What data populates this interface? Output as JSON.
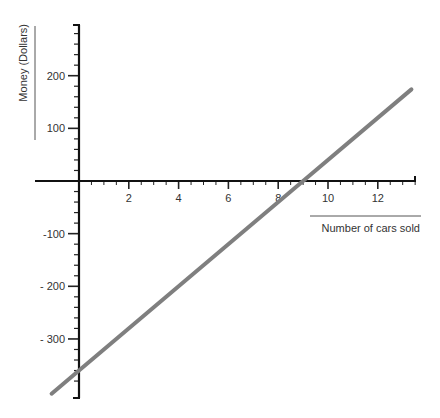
{
  "chart_data": {
    "type": "line",
    "title": "",
    "xlabel": "Number of cars sold",
    "ylabel": "Money (Dollars)",
    "xlim": [
      0,
      13.5
    ],
    "ylim": [
      -390,
      270
    ],
    "x_ticks": [
      2,
      4,
      6,
      8,
      10,
      12
    ],
    "x_tick_labels": [
      "2",
      "4",
      "6",
      "8",
      "10",
      "12"
    ],
    "y_ticks": [
      200,
      100,
      -100,
      -200,
      -300
    ],
    "y_tick_labels": [
      "200",
      "100",
      "-100",
      "- 200",
      "- 300"
    ],
    "grid": false,
    "legend": null,
    "series": [
      {
        "name": "profit",
        "equation": "y = 40x - 360",
        "x": [
          -1.1,
          0,
          9,
          13.35
        ],
        "values": [
          -404,
          -360,
          0,
          174
        ],
        "color": "#7f7f7f"
      }
    ]
  },
  "colors": {
    "axis": "#111111",
    "line": "#7f7f7f",
    "text": "#333333",
    "background": "#ffffff"
  }
}
